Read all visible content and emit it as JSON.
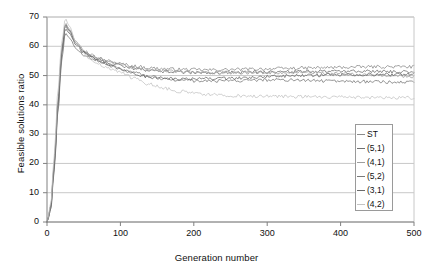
{
  "chart_data": {
    "type": "line",
    "title": "",
    "xlabel": "Generation number",
    "ylabel": "Feasible solutions ratio",
    "xlim": [
      0,
      500
    ],
    "ylim": [
      0,
      70
    ],
    "xticks": [
      0,
      100,
      200,
      300,
      400,
      500
    ],
    "yticks": [
      0,
      10,
      20,
      30,
      40,
      50,
      60,
      70
    ],
    "grid": "horizontal",
    "legend_position": "inside-lower-right",
    "series": [
      {
        "name": "ST",
        "color": "#8c8c8c",
        "x": [
          0,
          5,
          10,
          15,
          20,
          25,
          30,
          40,
          50,
          60,
          70,
          80,
          90,
          100,
          120,
          140,
          160,
          180,
          200,
          220,
          240,
          260,
          280,
          300,
          320,
          340,
          360,
          380,
          400,
          420,
          440,
          460,
          480,
          500
        ],
        "values": [
          0,
          5,
          20,
          40,
          58,
          67,
          65,
          61,
          58.5,
          57,
          56,
          55.2,
          54.6,
          54,
          53.2,
          52.6,
          52.3,
          52.1,
          52,
          51.9,
          52,
          52.1,
          52.2,
          52.3,
          52.4,
          52.5,
          52.6,
          52.7,
          52.8,
          52.9,
          53,
          53,
          53,
          53
        ]
      },
      {
        "name": "(5,1)",
        "color": "#707070",
        "x": [
          0,
          5,
          10,
          15,
          20,
          25,
          30,
          40,
          50,
          60,
          70,
          80,
          90,
          100,
          120,
          140,
          160,
          180,
          200,
          220,
          240,
          260,
          280,
          300,
          320,
          340,
          360,
          380,
          400,
          420,
          440,
          460,
          480,
          500
        ],
        "values": [
          0,
          4,
          19,
          39,
          57,
          66,
          64.5,
          60.5,
          58,
          56.5,
          55.5,
          54.6,
          54,
          53.4,
          52.4,
          51.8,
          51.4,
          51.1,
          51,
          50.9,
          51,
          51.1,
          51.2,
          51.3,
          51.3,
          51.4,
          51.4,
          51.5,
          51.5,
          51.5,
          51.5,
          51.4,
          51.3,
          51.2
        ]
      },
      {
        "name": "(4,1)",
        "color": "#9e9e9e",
        "x": [
          0,
          5,
          10,
          15,
          20,
          25,
          30,
          40,
          50,
          60,
          70,
          80,
          90,
          100,
          120,
          140,
          160,
          180,
          200,
          220,
          240,
          260,
          280,
          300,
          320,
          340,
          360,
          380,
          400,
          420,
          440,
          460,
          480,
          500
        ],
        "values": [
          0,
          5,
          21,
          42,
          59,
          68,
          66,
          61.5,
          58.5,
          57,
          56,
          55,
          54.2,
          53.6,
          52.6,
          52,
          51.6,
          51.3,
          51.1,
          51,
          51,
          51,
          51,
          51,
          51,
          51,
          50.9,
          50.8,
          50.6,
          50.4,
          50.2,
          50,
          49.8,
          49.6
        ]
      },
      {
        "name": "(5,2)",
        "color": "#7a7a7a",
        "x": [
          0,
          5,
          10,
          15,
          20,
          25,
          30,
          40,
          50,
          60,
          70,
          80,
          90,
          100,
          120,
          140,
          160,
          180,
          200,
          220,
          240,
          260,
          280,
          300,
          320,
          340,
          360,
          380,
          400,
          420,
          440,
          460,
          480,
          500
        ],
        "values": [
          0,
          4,
          18,
          38,
          55,
          64.5,
          63,
          59,
          57,
          56,
          55,
          54,
          53,
          52.2,
          50.8,
          49.6,
          48.8,
          48.4,
          48.2,
          48.1,
          48.2,
          48.3,
          48.4,
          48.5,
          48.5,
          48.4,
          48.3,
          48.2,
          48.1,
          48,
          47.9,
          47.8,
          47.8,
          47.8
        ]
      },
      {
        "name": "(3,1)",
        "color": "#6b6b6b",
        "x": [
          0,
          5,
          10,
          15,
          20,
          25,
          30,
          40,
          50,
          60,
          70,
          80,
          90,
          100,
          120,
          140,
          160,
          180,
          200,
          220,
          240,
          260,
          280,
          300,
          320,
          340,
          360,
          380,
          400,
          420,
          440,
          460,
          480,
          500
        ],
        "values": [
          0,
          5,
          20,
          41,
          58,
          67.5,
          65.5,
          61,
          58,
          56.5,
          55,
          54,
          53,
          52,
          50.5,
          49.5,
          49,
          48.8,
          48.8,
          48.9,
          49,
          49.2,
          49.4,
          49.6,
          49.8,
          50,
          50.1,
          50.2,
          50.3,
          50.3,
          50.4,
          50.4,
          50.5,
          50.5
        ]
      },
      {
        "name": "(4,2)",
        "color": "#c4c4c4",
        "x": [
          0,
          5,
          10,
          15,
          20,
          25,
          30,
          40,
          50,
          60,
          70,
          80,
          90,
          100,
          120,
          140,
          160,
          180,
          200,
          220,
          240,
          260,
          280,
          300,
          320,
          340,
          360,
          380,
          400,
          420,
          440,
          460,
          480,
          500
        ],
        "values": [
          0,
          6,
          23,
          45,
          61,
          69.5,
          67,
          61,
          57.5,
          55.5,
          54,
          53,
          52,
          51,
          49,
          47,
          45.6,
          44.6,
          44,
          43.6,
          43.3,
          43.1,
          43,
          43,
          42.9,
          42.8,
          42.8,
          42.7,
          42.6,
          42.6,
          42.5,
          42.5,
          42.4,
          42.4
        ]
      }
    ]
  },
  "legend": {
    "entries": [
      {
        "label": "ST"
      },
      {
        "label": "(5,1)"
      },
      {
        "label": "(4,1)"
      },
      {
        "label": "(5,2)"
      },
      {
        "label": "(3,1)"
      },
      {
        "label": "(4,2)"
      }
    ]
  },
  "colors": {
    "grid": "#c8c8c8",
    "axis": "#808080",
    "text": "#111111",
    "legend_border": "#9a9a9a"
  }
}
